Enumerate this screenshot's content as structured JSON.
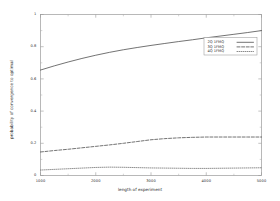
{
  "chart_data": {
    "type": "line",
    "title": "",
    "xlabel": "length of experiment",
    "ylabel": "probability of convergence to optimal",
    "xlim": [
      1000,
      5000
    ],
    "ylim": [
      0,
      1
    ],
    "xticks": [
      "1000",
      "2000",
      "3000",
      "4000",
      "5000"
    ],
    "xtick_values": [
      1000,
      2000,
      3000,
      4000,
      5000
    ],
    "yticks": [
      "0",
      "0.2",
      "0.4",
      "0.6",
      "0.8",
      "1"
    ],
    "ytick_values": [
      0,
      0.2,
      0.4,
      0.6,
      0.8,
      1
    ],
    "grid": false,
    "legend_position": "top-right-inside",
    "x": [
      1000,
      1250,
      1500,
      1750,
      2000,
      2250,
      2500,
      2750,
      3000,
      3250,
      3500,
      3750,
      4000,
      4250,
      4500,
      4750,
      5000
    ],
    "series": [
      {
        "name": "2Q 1FMQ",
        "dash": "solid",
        "color": "#444444",
        "values": [
          0.655,
          0.681,
          0.705,
          0.727,
          0.747,
          0.765,
          0.781,
          0.795,
          0.808,
          0.82,
          0.832,
          0.843,
          0.855,
          0.866,
          0.877,
          0.888,
          0.9
        ]
      },
      {
        "name": "3Q 1FMQ",
        "dash": "dashed",
        "color": "#444444",
        "values": [
          0.146,
          0.155,
          0.163,
          0.172,
          0.181,
          0.19,
          0.2,
          0.211,
          0.222,
          0.229,
          0.234,
          0.237,
          0.239,
          0.239,
          0.239,
          0.239,
          0.239
        ]
      },
      {
        "name": "4Q 1FMQ",
        "dash": "dotted",
        "color": "#666666",
        "values": [
          0.034,
          0.038,
          0.042,
          0.046,
          0.05,
          0.052,
          0.051,
          0.049,
          0.047,
          0.046,
          0.045,
          0.044,
          0.044,
          0.045,
          0.046,
          0.047,
          0.048
        ]
      }
    ]
  },
  "legend": {
    "items": [
      {
        "label": "2Q 1FMQ"
      },
      {
        "label": "3Q 1FMQ"
      },
      {
        "label": "4Q 1FMQ"
      }
    ]
  }
}
